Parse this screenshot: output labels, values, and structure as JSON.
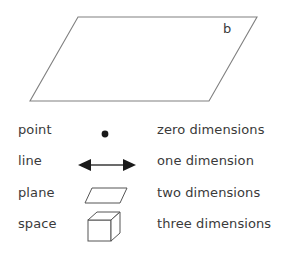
{
  "figure": {
    "background_color": "#ffffff",
    "stroke_color": "#808080",
    "dark_stroke_color": "#555555",
    "text_color": "#3a3a3a",
    "plane": {
      "label": "b",
      "shape": "parallelogram",
      "name": "large-plane-parallelogram"
    },
    "table": {
      "rows": [
        {
          "term": "point",
          "icon": "point-dot-icon",
          "description": "zero dimensions"
        },
        {
          "term": "line",
          "icon": "double-headed-arrow-icon",
          "description": "one dimension"
        },
        {
          "term": "plane",
          "icon": "parallelogram-icon",
          "description": "two dimensions"
        },
        {
          "term": "space",
          "icon": "cube-icon",
          "description": "three dimensions"
        }
      ]
    }
  }
}
